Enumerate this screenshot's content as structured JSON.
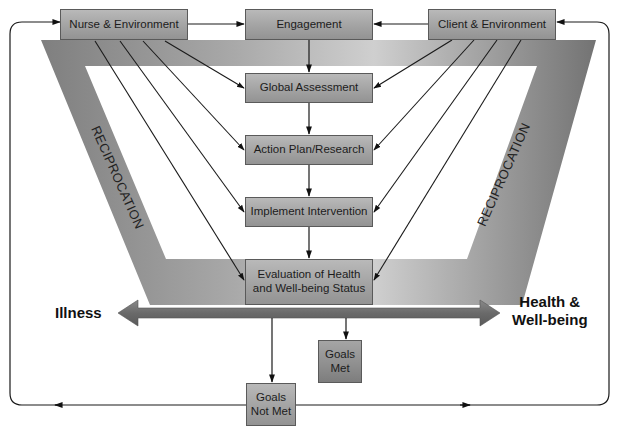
{
  "diagram": {
    "type": "nursing process / reciprocation model",
    "colors": {
      "funnel_light": "#c9c9c9",
      "funnel_dark": "#7a7a7a",
      "box_fill": "#a8a8a8",
      "box_border": "#5a5a5a",
      "arrow_bar": "#6e6e6e",
      "line": "#1a1a1a",
      "background": "#ffffff"
    },
    "top_row": {
      "nurse": "Nurse & Environment",
      "engagement": "Engagement",
      "client": "Client & Environment"
    },
    "process_steps": [
      {
        "id": "global",
        "label": "Global Assessment"
      },
      {
        "id": "action",
        "label": "Action Plan/Research"
      },
      {
        "id": "implement",
        "label": "Implement Intervention"
      },
      {
        "id": "evaluation",
        "label": "Evaluation of Health\nand Well-being Status"
      }
    ],
    "side_labels": {
      "left": "RECIPROCATION",
      "right": "RECIPROCATION"
    },
    "continuum": {
      "left": "Illness",
      "right": "Health &\nWell-being"
    },
    "outcomes": {
      "met": "Goals\nMet",
      "not_met": "Goals\nNot Met"
    },
    "edges": [
      {
        "from": "Nurse & Environment",
        "to": "Engagement"
      },
      {
        "from": "Client & Environment",
        "to": "Engagement"
      },
      {
        "from": "Engagement",
        "to": "Global Assessment"
      },
      {
        "from": "Global Assessment",
        "to": "Action Plan/Research"
      },
      {
        "from": "Action Plan/Research",
        "to": "Implement Intervention"
      },
      {
        "from": "Implement Intervention",
        "to": "Evaluation of Health and Well-being Status"
      },
      {
        "from": "Nurse & Environment",
        "to": "Global Assessment"
      },
      {
        "from": "Nurse & Environment",
        "to": "Action Plan/Research"
      },
      {
        "from": "Nurse & Environment",
        "to": "Implement Intervention"
      },
      {
        "from": "Nurse & Environment",
        "to": "Evaluation of Health and Well-being Status"
      },
      {
        "from": "Client & Environment",
        "to": "Global Assessment"
      },
      {
        "from": "Client & Environment",
        "to": "Action Plan/Research"
      },
      {
        "from": "Client & Environment",
        "to": "Implement Intervention"
      },
      {
        "from": "Client & Environment",
        "to": "Evaluation of Health and Well-being Status"
      },
      {
        "from": "Illness-Health continuum",
        "to": "Goals Met"
      },
      {
        "from": "Illness-Health continuum",
        "to": "Goals Not Met"
      },
      {
        "from": "Goals Not Met",
        "to": "Nurse & Environment"
      },
      {
        "from": "Goals Not Met",
        "to": "Client & Environment"
      }
    ]
  }
}
